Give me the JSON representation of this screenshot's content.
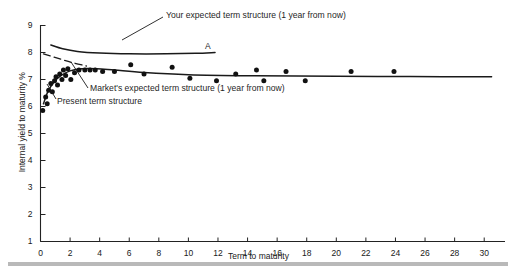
{
  "figure": {
    "background_color": "#ffffff",
    "ink_color": "#1f1f1f",
    "rule_color": "#b9b9b9"
  },
  "axes": {
    "x_label": "Term to maturity",
    "y_label": "Internal yield to maturity %",
    "x_ticks": [
      "0",
      "2",
      "4",
      "6",
      "8",
      "10",
      "12",
      "14",
      "16",
      "18",
      "20",
      "22",
      "24",
      "26",
      "28",
      "30"
    ],
    "y_ticks": [
      "1",
      "2",
      "3",
      "4",
      "5",
      "6",
      "7",
      "8",
      "9"
    ]
  },
  "annotations": {
    "your_expected": "Your expected term structure (1 year from now)",
    "markets_expected": "Market's expected term structure (1 year from now)",
    "present": "Present term structure",
    "point_a": "A"
  },
  "chart_data": {
    "type": "scatter",
    "title": "",
    "xlabel": "Term to maturity",
    "ylabel": "Internal yield to maturity %",
    "xlim": [
      0,
      31
    ],
    "ylim": [
      1,
      9
    ],
    "grid": false,
    "legend": "none (inline annotated labels)",
    "scatter": {
      "name": "Observed bond yields",
      "marker": "filled circle",
      "color": "#111111",
      "points": [
        [
          0.15,
          5.85
        ],
        [
          0.35,
          6.35
        ],
        [
          0.45,
          6.1
        ],
        [
          0.55,
          6.6
        ],
        [
          0.7,
          6.85
        ],
        [
          0.8,
          6.55
        ],
        [
          0.95,
          6.95
        ],
        [
          1.05,
          7.1
        ],
        [
          1.15,
          6.8
        ],
        [
          1.3,
          7.2
        ],
        [
          1.45,
          7.0
        ],
        [
          1.55,
          7.35
        ],
        [
          1.7,
          7.15
        ],
        [
          1.85,
          7.4
        ],
        [
          2.05,
          7.0
        ],
        [
          2.3,
          7.25
        ],
        [
          2.6,
          7.35
        ],
        [
          3.0,
          7.35
        ],
        [
          3.35,
          7.35
        ],
        [
          3.7,
          7.35
        ],
        [
          4.2,
          7.3
        ],
        [
          5.0,
          7.3
        ],
        [
          6.1,
          7.55
        ],
        [
          7.0,
          7.2
        ],
        [
          8.9,
          7.45
        ],
        [
          10.1,
          7.05
        ],
        [
          11.9,
          6.95
        ],
        [
          13.2,
          7.2
        ],
        [
          14.6,
          7.35
        ],
        [
          15.1,
          6.95
        ],
        [
          16.6,
          7.3
        ],
        [
          17.9,
          6.95
        ],
        [
          21.0,
          7.3
        ],
        [
          23.9,
          7.3
        ]
      ]
    },
    "curves": [
      {
        "name": "Your expected term structure (1 year from now)",
        "style": "solid",
        "points": [
          [
            0.7,
            8.28
          ],
          [
            1.5,
            8.14
          ],
          [
            2.5,
            8.04
          ],
          [
            4.0,
            7.98
          ],
          [
            6.0,
            7.95
          ],
          [
            8.5,
            7.95
          ],
          [
            10.5,
            7.97
          ],
          [
            11.8,
            8.0
          ]
        ]
      },
      {
        "name": "Market's expected term structure (1 year from now)",
        "style": "solid",
        "points": [
          [
            0.2,
            6.1
          ],
          [
            0.5,
            6.55
          ],
          [
            0.9,
            6.9
          ],
          [
            1.4,
            7.15
          ],
          [
            2.0,
            7.32
          ],
          [
            2.8,
            7.4
          ],
          [
            3.8,
            7.4
          ],
          [
            5.0,
            7.35
          ],
          [
            7.0,
            7.26
          ],
          [
            10.0,
            7.18
          ],
          [
            14.0,
            7.14
          ],
          [
            20.0,
            7.12
          ],
          [
            25.0,
            7.11
          ],
          [
            30.5,
            7.1
          ]
        ]
      },
      {
        "name": "Present term structure",
        "style": "dashed",
        "points": [
          [
            0.2,
            7.95
          ],
          [
            1.2,
            7.78
          ],
          [
            2.2,
            7.62
          ],
          [
            3.1,
            7.5
          ]
        ]
      }
    ]
  }
}
